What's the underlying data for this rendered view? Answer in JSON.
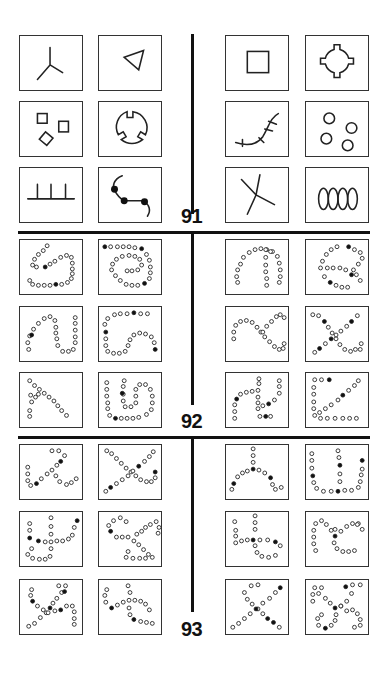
{
  "puzzles": [
    {
      "number": "91",
      "figures": [
        "three-pronged-star",
        "small-triangle",
        "square-outline",
        "circle-with-four-tabs",
        "three-squares",
        "circle-with-three-notches",
        "curved-line-with-crossbars",
        "four-circles",
        "comb-with-three-teeth",
        "curve-with-three-dots",
        "crossing-lines",
        "four-ovals-chain"
      ]
    },
    {
      "number": "92",
      "figures": [
        "dot-loop-a",
        "dot-loop-b",
        "dot-arch",
        "dot-curve-crossing",
        "dot-wave",
        "dot-s-curve",
        "dot-sine",
        "dot-x-cross",
        "dot-diagonal-and-base",
        "dot-double-loop",
        "dot-loop-n-shape",
        "dot-v-shape"
      ]
    },
    {
      "number": "93",
      "figures": [
        "dot-w-shape",
        "dot-x-shape",
        "dot-y-shape",
        "dot-u-with-stem",
        "dot-t-branch",
        "dot-cross-loop",
        "dot-plus-curve",
        "dot-s-wave",
        "dot-double-x",
        "dot-knot",
        "dot-x-pattern",
        "dot-x-loop"
      ]
    }
  ]
}
